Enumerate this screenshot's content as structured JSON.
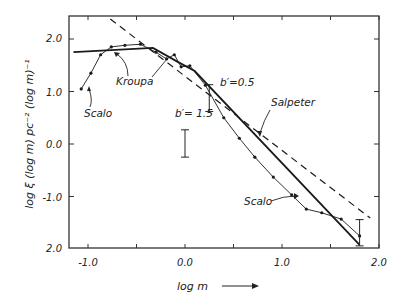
{
  "chart_data": {
    "type": "line",
    "title": "",
    "xlabel": "log m",
    "ylabel": "log ξ (log m)  pc⁻² (log m)⁻¹",
    "xlim": [
      -1.2,
      2.0
    ],
    "ylim": [
      -2.0,
      2.35
    ],
    "grid": false,
    "legend": null,
    "x_ticks": [
      -1.0,
      -0.5,
      0.0,
      0.5,
      1.0,
      1.5,
      2.0
    ],
    "x_tick_labels": [
      "-1.0",
      "0.0",
      "1.0",
      "2.0"
    ],
    "y_ticks": [
      2.0,
      1.0,
      0.0,
      -1.0,
      -2.0
    ],
    "y_tick_labels": [
      "2.0",
      "1.0",
      "0.0",
      "-1.0",
      "2.0"
    ],
    "series": [
      {
        "name": "Salpeter",
        "style": "dashed",
        "x": [
          -0.77,
          1.91
        ],
        "y": [
          2.38,
          -1.41
        ]
      },
      {
        "name": "Kroupa",
        "style": "solid-thick",
        "x": [
          -1.15,
          -0.33,
          -0.07,
          0.1,
          1.8
        ],
        "y": [
          1.75,
          1.83,
          1.56,
          1.39,
          -1.92
        ]
      },
      {
        "name": "Scalo",
        "style": "solid-thin-with-dots",
        "x": [
          -1.07,
          -0.97,
          -0.87,
          -0.76,
          -0.62,
          -0.46,
          -0.3,
          -0.19,
          -0.11,
          -0.04,
          0.05,
          0.21,
          0.4,
          0.56,
          0.72,
          0.91,
          1.1,
          1.25,
          1.41,
          1.61,
          1.8
        ],
        "y": [
          1.05,
          1.35,
          1.7,
          1.85,
          1.88,
          1.9,
          1.75,
          1.62,
          1.7,
          1.47,
          1.49,
          1.12,
          0.5,
          0.11,
          -0.25,
          -0.63,
          -0.97,
          -1.24,
          -1.31,
          -1.43,
          -1.75
        ]
      }
    ],
    "error_bars": [
      {
        "x": 0.0,
        "y_low": -0.25,
        "y_high": 0.27
      },
      {
        "x": 0.25,
        "y_low": 0.62,
        "y_high": 1.13
      },
      {
        "x": 1.8,
        "y_low": -1.94,
        "y_high": -1.44
      }
    ],
    "annotations": [
      {
        "text": "Scalo",
        "near": [
          -1.0,
          0.2
        ]
      },
      {
        "text": "Kroupa",
        "near": [
          -0.8,
          1.2
        ]
      },
      {
        "text": "b′= 1.5",
        "near": [
          -0.05,
          0.75
        ]
      },
      {
        "text": "b′=0.5",
        "near": [
          0.45,
          1.0
        ]
      },
      {
        "text": "Salpeter",
        "near": [
          0.85,
          0.55
        ]
      },
      {
        "text": "Scalo",
        "near": [
          0.8,
          -1.15
        ]
      }
    ]
  },
  "labels": {
    "x_axis": "log  m",
    "x_arrow": "→",
    "y_axis": "log ξ (log m)  pc⁻² (log m)⁻¹",
    "tick_x": [
      "-1.0",
      "0.0",
      "1.0",
      "2.0"
    ],
    "tick_y": [
      "2.0",
      "1.0",
      "0.0",
      "-1.0",
      "2.0"
    ],
    "anno_scalo_left": "Scalo",
    "anno_kroupa": "Kroupa",
    "anno_b15": "b′= 1.5",
    "anno_b05": "b′=0.5",
    "anno_salpeter": "Salpeter",
    "anno_scalo_right": "Scalo"
  }
}
